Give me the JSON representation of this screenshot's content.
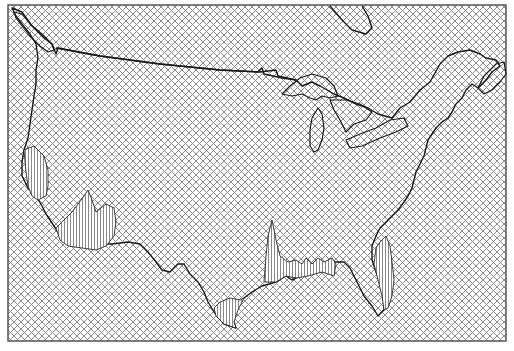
{
  "map": {
    "subject": "Contiguous United States",
    "frame": {
      "x": 8,
      "y": 5,
      "width": 498,
      "height": 336
    },
    "colors": {
      "hatch": "#8a8a8a",
      "outline": "#1a1a1a",
      "frame": "#555555",
      "spike_hatch": "#555555",
      "background": "#ffffff"
    },
    "hatch_spacing_px": 7,
    "paths": {
      "us_outline": "M 12 8 L 22 12 L 32 26 L 44 38 L 52 44 L 56 54 L 58 48 L 100 56 L 160 64 L 220 70 L 260 72 L 276 70 L 278 76 L 296 80 L 302 86 L 312 82 L 320 86 L 334 94 L 344 98 L 356 104 L 368 108 L 378 114 L 392 118 L 400 108 L 410 102 L 420 90 L 430 82 L 440 64 L 448 56 L 458 52 L 470 50 L 480 54 L 486 58 L 496 60 L 500 66 L 492 72 L 486 80 L 478 88 L 472 84 L 466 90 L 462 98 L 456 104 L 452 112 L 448 118 L 442 122 L 436 128 L 432 134 L 428 140 L 426 148 L 424 156 L 420 164 L 416 172 L 414 180 L 412 188 L 408 196 L 404 202 L 398 210 L 392 216 L 386 222 L 380 228 L 376 236 L 372 246 L 372 260 L 376 272 L 382 286 L 384 300 L 384 310 L 378 316 L 372 306 L 364 296 L 356 280 L 350 268 L 344 262 L 334 262 L 324 270 L 312 272 L 300 276 L 292 280 L 286 276 L 276 282 L 262 286 L 252 292 L 244 298 L 236 306 L 232 316 L 236 328 L 224 324 L 214 312 L 208 302 L 204 292 L 198 282 L 190 274 L 184 264 L 178 264 L 170 272 L 162 270 L 156 262 L 148 252 L 140 244 L 128 242 L 112 244 L 98 244 L 82 244 L 70 244 L 62 238 L 54 226 L 46 214 L 42 206 L 36 196 L 28 188 L 22 176 L 22 162 L 24 150 L 28 138 L 30 124 L 32 110 L 34 96 L 36 84 L 36 70 L 38 58 L 36 44 L 30 34 L 22 24 L 16 16 Z",
      "canada_boundary": "M 56 48 L 100 56 L 160 64 L 220 70 L 258 72 L 262 68 L 264 74 L 282 78 L 296 80",
      "lake_superior": "M 282 94 L 290 86 L 300 78 L 312 74 L 326 78 L 334 86 L 338 96 L 330 98 L 322 96 L 316 100 L 310 98 L 302 94 L 292 96 Z",
      "lake_michigan": "M 318 108 L 322 114 L 324 128 L 322 140 L 318 150 L 314 152 L 310 146 L 310 130 L 312 118 Z",
      "lake_huron": "M 330 100 L 346 100 L 360 104 L 372 112 L 366 120 L 354 124 L 346 132 L 340 120 L 334 110 Z",
      "lake_erie_ontario": "M 346 140 L 360 134 L 376 128 L 390 120 L 404 118 L 408 126 L 396 132 L 380 138 L 362 146 L 350 148 Z",
      "hudson_bay_edge": "M 330 6 L 342 20 L 352 30 L 366 34 L 372 28 L 368 16 L 362 6",
      "puget_sound": "M 14 12 L 22 14 L 30 24 L 42 34 L 52 44 L 54 50 L 48 52 L 40 46 L 30 36 L 22 26 L 16 18 Z",
      "newfoundland": "M 478 88 L 484 76 L 496 64 L 504 62 L 506 74 L 500 82 L 492 90 L 484 94 Z"
    },
    "spikes": [
      {
        "name": "california-south",
        "path": "M 24 150 L 34 146 L 44 156 L 48 170 L 48 186 L 46 196 L 38 200 L 32 196 L 28 186 L 26 172 Z"
      },
      {
        "name": "baja-arizona",
        "path": "M 56 228 L 72 212 L 84 196 L 88 190 L 92 200 L 96 212 L 106 204 L 114 208 L 116 222 L 114 236 L 106 246 L 96 250 L 82 248 L 68 246 L 60 240 Z"
      },
      {
        "name": "texas-louisiana-peak",
        "path": "M 264 282 L 266 256 L 268 236 L 272 220 L 276 240 L 280 256 L 288 262 L 296 260 L 302 264 L 306 258 L 312 264 L 318 258 L 324 262 L 332 258 L 336 264 L 334 276 L 322 272 L 308 276 L 296 278 L 286 276 L 276 282 Z"
      },
      {
        "name": "south-texas",
        "path": "M 214 308 L 220 302 L 230 298 L 240 300 L 244 298 L 238 310 L 234 322 L 236 328 L 224 324 L 216 316 Z"
      },
      {
        "name": "florida",
        "path": "M 376 248 L 380 242 L 386 236 L 390 246 L 392 262 L 394 280 L 392 296 L 388 308 L 384 310 L 382 296 L 378 280 L 374 264 Z"
      }
    ]
  }
}
